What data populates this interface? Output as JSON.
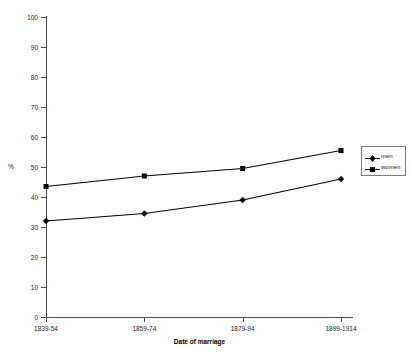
{
  "chart_data": {
    "type": "line",
    "title": "",
    "xlabel": "Date of marriage",
    "ylabel": "%",
    "categories": [
      "1839-54",
      "1859-74",
      "1879-94",
      "1899-1914"
    ],
    "series": [
      {
        "name": "men",
        "marker": "diamond",
        "values": [
          32,
          34.5,
          39,
          46
        ]
      },
      {
        "name": "women",
        "marker": "square",
        "values": [
          43.5,
          47,
          49.5,
          55.5
        ]
      }
    ],
    "ylim": [
      0,
      100
    ],
    "yticks": [
      0,
      10,
      20,
      30,
      40,
      50,
      60,
      70,
      80,
      90,
      100
    ],
    "ytick_labels": [
      "0",
      "10",
      "20",
      "30",
      "40",
      "50",
      "60",
      "70",
      "80",
      "90",
      "100"
    ],
    "grid": false,
    "legend_position": "right",
    "line_color": "#000000",
    "axis_color": "#4a4a4a"
  },
  "legend": {
    "entries": [
      {
        "label": "men"
      },
      {
        "label": "women"
      }
    ]
  }
}
